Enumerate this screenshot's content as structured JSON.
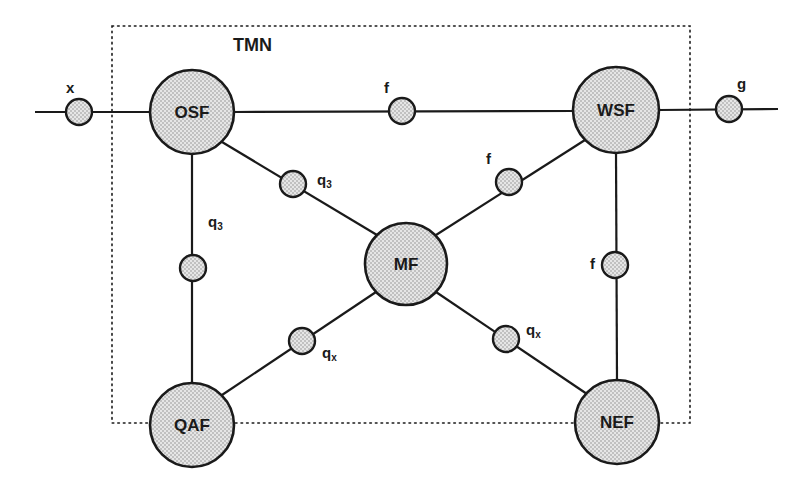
{
  "diagram": {
    "title": "TMN",
    "boundary": {
      "x": 112,
      "y": 26,
      "w": 578,
      "h": 397,
      "style": "dotted"
    },
    "colors": {
      "stroke": "#1a1a1a",
      "fill": "#d8d8d8",
      "dot": "#8a8a8a"
    },
    "function_blocks": [
      {
        "id": "osf",
        "label": "OSF",
        "cx": 192,
        "cy": 112,
        "r": 42
      },
      {
        "id": "wsf",
        "label": "WSF",
        "cx": 616,
        "cy": 110,
        "r": 43
      },
      {
        "id": "mf",
        "label": "MF",
        "cx": 406,
        "cy": 264,
        "r": 41
      },
      {
        "id": "qaf",
        "label": "QAF",
        "cx": 192,
        "cy": 425,
        "r": 42
      },
      {
        "id": "nef",
        "label": "NEF",
        "cx": 617,
        "cy": 422,
        "r": 42
      }
    ],
    "reference_points": [
      {
        "id": "x-ref",
        "name": "x",
        "sub": "",
        "cx": 79,
        "cy": 112,
        "lx": 66,
        "ly": 80
      },
      {
        "id": "f-osf-wsf",
        "name": "f",
        "sub": "",
        "cx": 402,
        "cy": 111,
        "lx": 384,
        "ly": 80
      },
      {
        "id": "g-ref",
        "name": "g",
        "sub": "",
        "cx": 729,
        "cy": 109,
        "lx": 737,
        "ly": 76
      },
      {
        "id": "q3-osf-mf",
        "name": "q",
        "sub": "3",
        "cx": 293,
        "cy": 184,
        "lx": 317,
        "ly": 172
      },
      {
        "id": "f-wsf-mf",
        "name": "f",
        "sub": "",
        "cx": 509,
        "cy": 182,
        "lx": 486,
        "ly": 151
      },
      {
        "id": "q3-osf-qaf",
        "name": "q",
        "sub": "3",
        "cx": 193,
        "cy": 268,
        "lx": 208,
        "ly": 214
      },
      {
        "id": "f-wsf-nef",
        "name": "f",
        "sub": "",
        "cx": 615,
        "cy": 265,
        "lx": 590,
        "ly": 256
      },
      {
        "id": "qx-mf-qaf",
        "name": "q",
        "sub": "x",
        "cx": 302,
        "cy": 341,
        "lx": 322,
        "ly": 345
      },
      {
        "id": "qx-mf-nef",
        "name": "q",
        "sub": "x",
        "cx": 506,
        "cy": 339,
        "lx": 526,
        "ly": 322
      }
    ],
    "ref_point_radius": 13,
    "links": [
      {
        "from": [
          35,
          112
        ],
        "to": [
          150,
          112
        ]
      },
      {
        "from": [
          234,
          112
        ],
        "to": [
          573,
          111
        ]
      },
      {
        "from": [
          659,
          110
        ],
        "to": [
          778,
          109
        ]
      },
      {
        "from": [
          222,
          142
        ],
        "to": [
          377,
          235
        ]
      },
      {
        "from": [
          585,
          140
        ],
        "to": [
          436,
          235
        ]
      },
      {
        "from": [
          192,
          154
        ],
        "to": [
          192,
          383
        ]
      },
      {
        "from": [
          616,
          153
        ],
        "to": [
          617,
          380
        ]
      },
      {
        "from": [
          376,
          292
        ],
        "to": [
          222,
          395
        ]
      },
      {
        "from": [
          436,
          292
        ],
        "to": [
          587,
          394
        ]
      }
    ]
  }
}
